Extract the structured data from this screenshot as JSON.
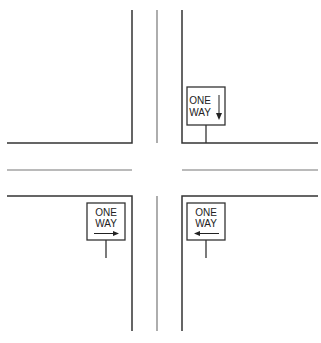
{
  "diagram": {
    "title": "",
    "signs": [
      {
        "id": "ne",
        "line1": "ONE",
        "line2": "WAY",
        "arrow": "down"
      },
      {
        "id": "sw",
        "line1": "ONE",
        "line2": "WAY",
        "arrow": "right"
      },
      {
        "id": "se",
        "line1": "ONE",
        "line2": "WAY",
        "arrow": "left"
      }
    ],
    "colors": {
      "line": "#333333",
      "centerline": "#777777",
      "background": "#ffffff"
    }
  }
}
